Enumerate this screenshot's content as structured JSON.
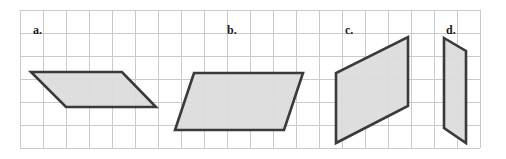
{
  "figure": {
    "background_color": "#ffffff",
    "width": 506,
    "height": 159
  },
  "grid": {
    "line_color": "#c9c9cf",
    "cell_size": 23,
    "origin_x": 20,
    "origin_y": 10,
    "columns": 21,
    "rows": 7,
    "x_lines": [
      20,
      43,
      66,
      89,
      112,
      135,
      158,
      181,
      204,
      227,
      250,
      273,
      296,
      319,
      342,
      365,
      388,
      411,
      434,
      457,
      480
    ],
    "y_lines": [
      10,
      33,
      56,
      79,
      102,
      125,
      148
    ]
  },
  "shapes": [
    {
      "id": "shape-a",
      "label": "a.",
      "label_x": 33,
      "label_y": 34,
      "fill_color": "#dcdcdc",
      "stroke_color": "#3a3a3a",
      "points": "31,72 122,72 156,107 66,107",
      "vertices": [
        [
          31,
          72
        ],
        [
          122,
          72
        ],
        [
          156,
          107
        ],
        [
          66,
          107
        ]
      ],
      "base_cells": 4,
      "height_cells": 1.5,
      "orientation": "wide-horizontal-slant-right"
    },
    {
      "id": "shape-b",
      "label": "b.",
      "label_x": 227,
      "label_y": 34,
      "fill_color": "#dcdcdc",
      "stroke_color": "#3a3a3a",
      "points": "194,73 303,73 284,130 175,130",
      "vertices": [
        [
          194,
          73
        ],
        [
          303,
          73
        ],
        [
          284,
          130
        ],
        [
          175,
          130
        ]
      ],
      "base_cells": 4.7,
      "height_cells": 2.5,
      "orientation": "wide-slant-left"
    },
    {
      "id": "shape-c",
      "label": "c.",
      "label_x": 345,
      "label_y": 34,
      "fill_color": "#dcdcdc",
      "stroke_color": "#3a3a3a",
      "points": "408,37 408,106 336,143 336,73",
      "vertices": [
        [
          408,
          37
        ],
        [
          408,
          106
        ],
        [
          336,
          143
        ],
        [
          336,
          73
        ]
      ],
      "base_cells": 3,
      "height_cells": 3,
      "orientation": "tall-vertical-slant-down"
    },
    {
      "id": "shape-d",
      "label": "d.",
      "label_x": 446,
      "label_y": 34,
      "fill_color": "#dcdcdc",
      "stroke_color": "#3a3a3a",
      "points": "444,38 466,51 466,143 444,128",
      "vertices": [
        [
          444,
          38
        ],
        [
          466,
          51
        ],
        [
          466,
          143
        ],
        [
          444,
          128
        ]
      ],
      "base_cells": 1,
      "height_cells": 4,
      "orientation": "narrow-tall-vertical"
    }
  ]
}
